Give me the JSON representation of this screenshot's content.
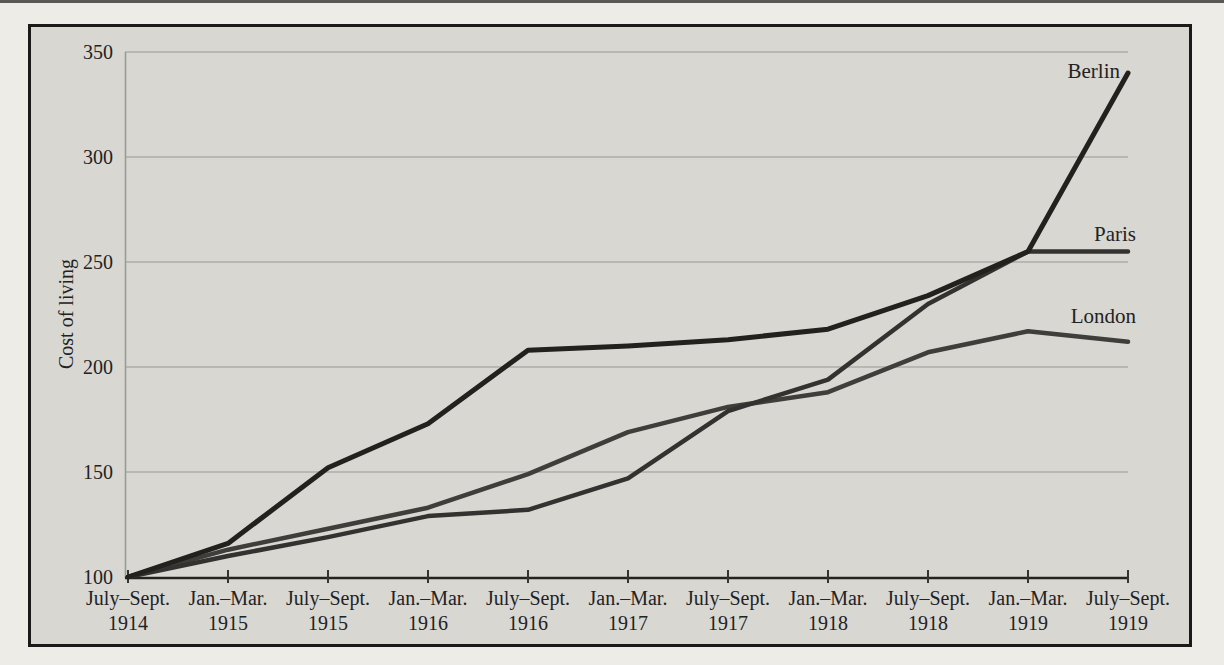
{
  "chart_data": {
    "type": "line",
    "title": "",
    "xlabel": "",
    "ylabel": "Cost of living",
    "ylim": [
      100,
      350
    ],
    "yticks": [
      100,
      150,
      200,
      250,
      300,
      350
    ],
    "grid": "horizontal",
    "legend": "inline-labels-at-line-ends",
    "background": "#d8d7d2",
    "gridline_color": "#aeada7",
    "axis_color": "#24231f",
    "categories": [
      {
        "period": "July–Sept.",
        "year": "1914"
      },
      {
        "period": "Jan.–Mar.",
        "year": "1915"
      },
      {
        "period": "July–Sept.",
        "year": "1915"
      },
      {
        "period": "Jan.–Mar.",
        "year": "1916"
      },
      {
        "period": "July–Sept.",
        "year": "1916"
      },
      {
        "period": "Jan.–Mar.",
        "year": "1917"
      },
      {
        "period": "July–Sept.",
        "year": "1917"
      },
      {
        "period": "Jan.–Mar.",
        "year": "1918"
      },
      {
        "period": "July–Sept.",
        "year": "1918"
      },
      {
        "period": "Jan.–Mar.",
        "year": "1919"
      },
      {
        "period": "July–Sept.",
        "year": "1919"
      }
    ],
    "series": [
      {
        "name": "Berlin",
        "color": "#22211e",
        "width": 5,
        "values": [
          100,
          116,
          152,
          173,
          208,
          210,
          213,
          218,
          234,
          255,
          340
        ],
        "label": {
          "x": 1120,
          "y": 78,
          "anchor": "end"
        }
      },
      {
        "name": "Paris",
        "color": "#343230",
        "width": 4.5,
        "values": [
          100,
          110,
          119,
          129,
          132,
          147,
          179,
          194,
          230,
          255,
          255
        ],
        "label": {
          "x": 1136,
          "y": 241,
          "anchor": "end"
        }
      },
      {
        "name": "London",
        "color": "#403e3a",
        "width": 4.5,
        "values": [
          100,
          113,
          123,
          133,
          149,
          169,
          181,
          188,
          207,
          217,
          212
        ],
        "label": {
          "x": 1136,
          "y": 323,
          "anchor": "end"
        }
      }
    ]
  }
}
